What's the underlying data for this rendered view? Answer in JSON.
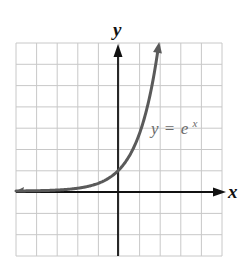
{
  "chart_data": {
    "type": "line",
    "title": "",
    "function": "y = e^x",
    "xlabel": "x",
    "ylabel": "y",
    "xlim": [
      -5,
      5
    ],
    "ylim": [
      -3,
      7
    ],
    "grid": true,
    "grid_step": 1,
    "series": [
      {
        "name": "y = e^x",
        "x": [
          -5,
          -4,
          -3,
          -2,
          -1,
          0,
          0.5,
          1,
          1.5,
          1.95
        ],
        "y": [
          0.0067,
          0.018,
          0.05,
          0.135,
          0.368,
          1,
          1.649,
          2.718,
          4.482,
          7.0
        ]
      }
    ],
    "annotations": [
      {
        "text": "y = e^x",
        "x": 1.6,
        "y": 2.8
      }
    ],
    "legend": "none"
  },
  "labels": {
    "x_axis": "x",
    "y_axis": "y",
    "curve_y": "y",
    "curve_eq": "=",
    "curve_e": "e",
    "curve_exp": "x"
  },
  "colors": {
    "grid": "#c8c8c8",
    "axes": "#111111",
    "curve": "#5a5a5a",
    "label": "#6a6a6a"
  }
}
